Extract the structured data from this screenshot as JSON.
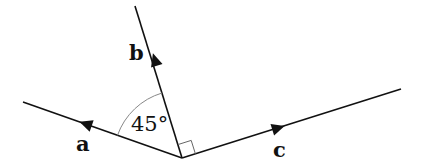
{
  "diagram": {
    "type": "vector-angle-diagram",
    "vertex": {
      "x": 182,
      "y": 158
    },
    "vectors": [
      {
        "id": "a",
        "label": "a",
        "end": {
          "x": 23,
          "y": 102
        },
        "arrow": {
          "x": 86,
          "y": 124
        },
        "label_pos": {
          "x": 83,
          "y": 150
        }
      },
      {
        "id": "b",
        "label": "b",
        "end": {
          "x": 135,
          "y": 6
        },
        "arrow": {
          "x": 155,
          "y": 60
        },
        "label_pos": {
          "x": 135,
          "y": 60
        }
      },
      {
        "id": "c",
        "label": "c",
        "end": {
          "x": 401,
          "y": 89
        },
        "arrow": {
          "x": 278,
          "y": 128
        },
        "label_pos": {
          "x": 280,
          "y": 158
        }
      }
    ],
    "angle_ab": {
      "label": "45°",
      "value_deg": 45
    },
    "angle_bc": {
      "label": "right-angle",
      "value_deg": 90
    },
    "colors": {
      "line": "#111111",
      "arc": "#888888",
      "background": "#ffffff"
    }
  }
}
